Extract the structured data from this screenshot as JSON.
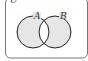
{
  "diagram": {
    "type": "venn",
    "universe_label": "U",
    "sets": [
      {
        "label": "A"
      },
      {
        "label": "B"
      }
    ],
    "shaded_region": "A Δ B (symmetric difference)",
    "colors": {
      "shade": "#e6e6e6",
      "stroke": "#222222",
      "border": "#777777",
      "background": "#ffffff"
    }
  }
}
